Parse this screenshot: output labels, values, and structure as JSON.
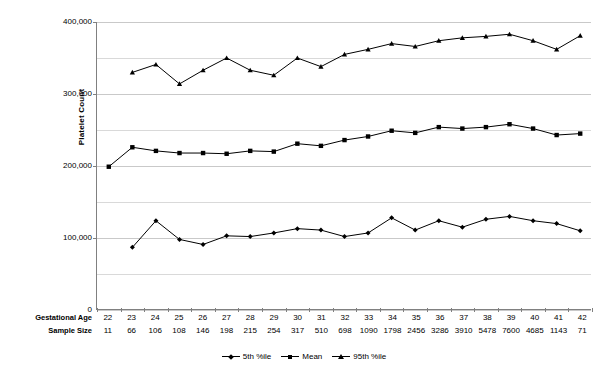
{
  "chart_data": {
    "type": "line",
    "title": "",
    "xlabel": "Gestational Age",
    "ylabel": "Platelet Count",
    "ylim": [
      0,
      400000
    ],
    "ytick_step": 100000,
    "grid_step": 50000,
    "grid": true,
    "legend_position": "bottom",
    "x": [
      22,
      23,
      24,
      25,
      26,
      27,
      28,
      29,
      30,
      31,
      32,
      33,
      34,
      35,
      36,
      37,
      38,
      39,
      40,
      41,
      42
    ],
    "categories": [
      "22",
      "23",
      "24",
      "25",
      "26",
      "27",
      "28",
      "29",
      "30",
      "31",
      "32",
      "33",
      "34",
      "35",
      "36",
      "37",
      "38",
      "39",
      "40",
      "41",
      "42"
    ],
    "sample_size": [
      11,
      66,
      106,
      108,
      146,
      198,
      215,
      254,
      317,
      510,
      698,
      1090,
      1798,
      2456,
      3286,
      3910,
      5478,
      7600,
      4685,
      1143,
      71
    ],
    "yticks": [
      "0",
      "100,000",
      "200,000",
      "300,000",
      "400,000"
    ],
    "ytick_values": [
      0,
      100000,
      200000,
      300000,
      400000
    ],
    "series": [
      {
        "name": "5th %ile",
        "marker": "diamond",
        "values": [
          null,
          87000,
          124000,
          98000,
          91000,
          103000,
          102000,
          107000,
          113000,
          111000,
          102000,
          107000,
          128000,
          111000,
          124000,
          115000,
          126000,
          130000,
          124000,
          120000,
          110000
        ]
      },
      {
        "name": "Mean",
        "marker": "square",
        "values": [
          199000,
          226000,
          221000,
          218000,
          218000,
          217000,
          221000,
          220000,
          231000,
          228000,
          236000,
          241000,
          249000,
          246000,
          254000,
          252000,
          254000,
          258000,
          252000,
          243000,
          245000
        ]
      },
      {
        "name": "95th %ile",
        "marker": "triangle",
        "values": [
          null,
          330000,
          341000,
          314000,
          333000,
          350000,
          333000,
          326000,
          350000,
          338000,
          355000,
          362000,
          370000,
          366000,
          374000,
          378000,
          380000,
          383000,
          374000,
          362000,
          381000
        ]
      }
    ]
  },
  "axis_rows": {
    "gestational_age_label": "Gestational Age",
    "sample_size_label": "Sample Size"
  },
  "legend": {
    "items": [
      {
        "label": "5th %ile"
      },
      {
        "label": "Mean"
      },
      {
        "label": "95th %ile"
      }
    ]
  },
  "colors": {
    "series": "#000000",
    "grid": "#d9d9d9",
    "axis": "#808080",
    "background": "#ffffff"
  }
}
